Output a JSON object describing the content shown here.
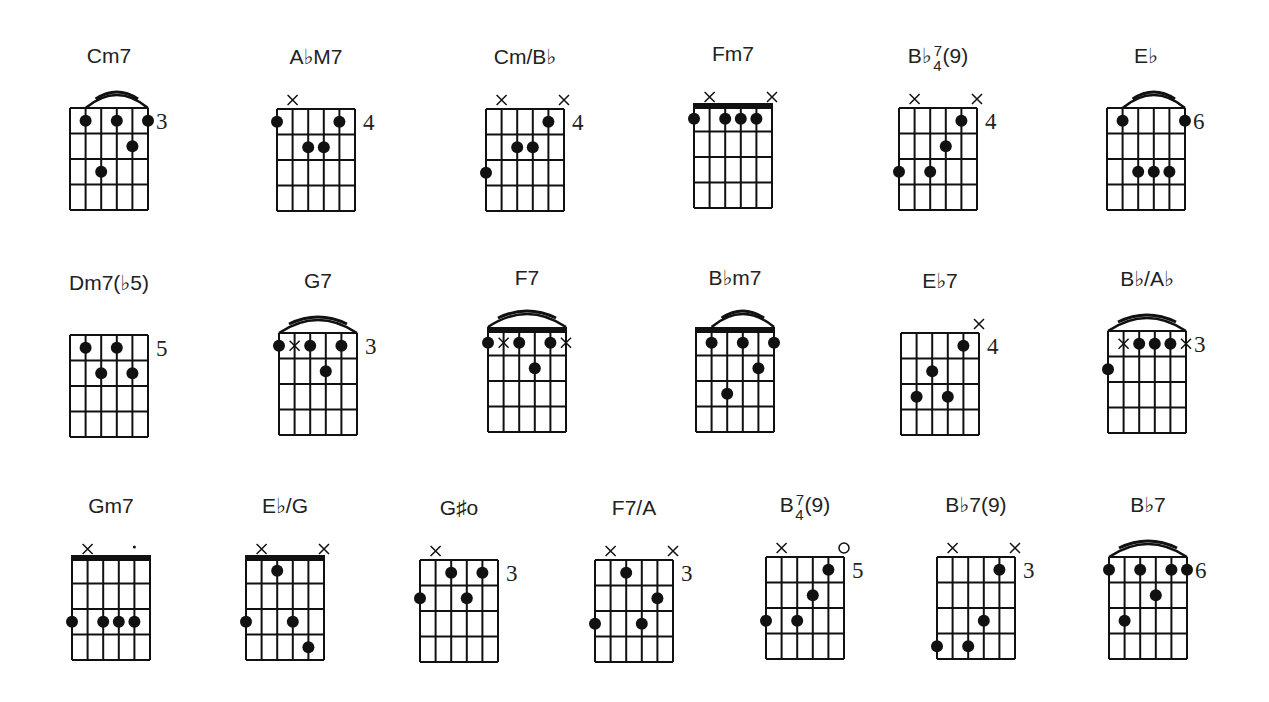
{
  "chords": [
    {
      "name": "Cm7",
      "root": "Cm7",
      "sup": "",
      "sub": "",
      "suffix": "",
      "fret": "3",
      "barre": "arc",
      "arc": [
        2,
        6
      ],
      "dots": [
        [
          2,
          1
        ],
        [
          4,
          1
        ],
        [
          6,
          1
        ],
        [
          5,
          2
        ],
        [
          3,
          3
        ]
      ],
      "mutes": [],
      "opens": []
    },
    {
      "name": "A♭M7",
      "root": "A♭M7",
      "sup": "",
      "sub": "",
      "suffix": "",
      "fret": "4",
      "barre": "none",
      "dots": [
        [
          1,
          1
        ],
        [
          5,
          1
        ],
        [
          3,
          2
        ],
        [
          4,
          2
        ]
      ],
      "mutes": [
        [
          2,
          0
        ]
      ],
      "opens": []
    },
    {
      "name": "Cm/B♭",
      "root": "Cm/B♭",
      "sup": "",
      "sub": "",
      "suffix": "",
      "fret": "4",
      "barre": "none",
      "dots": [
        [
          5,
          1
        ],
        [
          3,
          2
        ],
        [
          4,
          2
        ],
        [
          1,
          3
        ]
      ],
      "mutes": [
        [
          2,
          0
        ],
        [
          6,
          0
        ]
      ],
      "opens": []
    },
    {
      "name": "Fm7",
      "root": "Fm7",
      "sup": "",
      "sub": "",
      "suffix": "",
      "fret": "",
      "barre": "nut",
      "dots": [
        [
          1,
          1
        ],
        [
          3,
          1
        ],
        [
          4,
          1
        ],
        [
          5,
          1
        ]
      ],
      "mutes": [
        [
          2,
          0
        ],
        [
          6,
          0
        ]
      ],
      "opens": []
    },
    {
      "name": "B♭7/4(9)",
      "root": "B♭",
      "sup": "7",
      "sub": "4",
      "suffix": "(9)",
      "fret": "4",
      "barre": "none",
      "dots": [
        [
          5,
          1
        ],
        [
          4,
          2
        ],
        [
          1,
          3
        ],
        [
          3,
          3
        ]
      ],
      "mutes": [
        [
          2,
          0
        ],
        [
          6,
          0
        ]
      ],
      "opens": []
    },
    {
      "name": "E♭",
      "root": "E♭",
      "sup": "",
      "sub": "",
      "suffix": "",
      "fret": "6",
      "barre": "arc",
      "arc": [
        2,
        6
      ],
      "dots": [
        [
          2,
          1
        ],
        [
          6,
          1
        ],
        [
          3,
          3
        ],
        [
          4,
          3
        ],
        [
          5,
          3
        ]
      ],
      "mutes": [],
      "opens": []
    },
    {
      "name": "Dm7(♭5)",
      "root": "Dm7(♭5)",
      "sup": "",
      "sub": "",
      "suffix": "",
      "fret": "5",
      "barre": "none",
      "dots": [
        [
          2,
          1
        ],
        [
          4,
          1
        ],
        [
          3,
          2
        ],
        [
          5,
          2
        ]
      ],
      "mutes": [],
      "opens": []
    },
    {
      "name": "G7",
      "root": "G7",
      "sup": "",
      "sub": "",
      "suffix": "",
      "fret": "3",
      "barre": "arc",
      "arc": [
        1,
        6
      ],
      "dots": [
        [
          1,
          1
        ],
        [
          3,
          1
        ],
        [
          5,
          1
        ],
        [
          4,
          2
        ]
      ],
      "mutes": [
        [
          2,
          1
        ]
      ],
      "opens": []
    },
    {
      "name": "F7",
      "root": "F7",
      "sup": "",
      "sub": "",
      "suffix": "",
      "fret": "",
      "barre": "arc+nut",
      "arc": [
        1,
        6
      ],
      "dots": [
        [
          1,
          1
        ],
        [
          3,
          1
        ],
        [
          5,
          1
        ],
        [
          4,
          2
        ]
      ],
      "mutes": [
        [
          2,
          1
        ],
        [
          6,
          1
        ]
      ],
      "opens": []
    },
    {
      "name": "B♭m7",
      "root": "B♭m7",
      "sup": "",
      "sub": "",
      "suffix": "",
      "fret": "",
      "barre": "arc+nut",
      "arc": [
        2,
        6
      ],
      "dots": [
        [
          2,
          1
        ],
        [
          4,
          1
        ],
        [
          6,
          1
        ],
        [
          5,
          2
        ],
        [
          3,
          3
        ]
      ],
      "mutes": [],
      "opens": []
    },
    {
      "name": "E♭7",
      "root": "E♭7",
      "sup": "",
      "sub": "",
      "suffix": "",
      "fret": "4",
      "barre": "none",
      "dots": [
        [
          5,
          1
        ],
        [
          3,
          2
        ],
        [
          2,
          3
        ],
        [
          4,
          3
        ]
      ],
      "mutes": [
        [
          6,
          0
        ]
      ],
      "opens": []
    },
    {
      "name": "B♭/A♭",
      "root": "B♭/A♭",
      "sup": "",
      "sub": "",
      "suffix": "",
      "fret": "3",
      "barre": "arc",
      "arc": [
        1,
        6
      ],
      "dots": [
        [
          3,
          1
        ],
        [
          4,
          1
        ],
        [
          5,
          1
        ],
        [
          1,
          2
        ]
      ],
      "mutes": [
        [
          2,
          1
        ],
        [
          6,
          1
        ]
      ],
      "opens": []
    },
    {
      "name": "Gm7",
      "root": "Gm7",
      "sup": "",
      "sub": "",
      "suffix": "",
      "fret": "",
      "barre": "nut",
      "dots": [
        [
          1,
          3
        ],
        [
          3,
          3
        ],
        [
          4,
          3
        ],
        [
          5,
          3
        ]
      ],
      "mutes": [
        [
          2,
          0
        ]
      ],
      "opens": [],
      "marks": [
        [
          5,
          0
        ]
      ]
    },
    {
      "name": "E♭/G",
      "root": "E♭/G",
      "sup": "",
      "sub": "",
      "suffix": "",
      "fret": "",
      "barre": "nut",
      "dots": [
        [
          3,
          1
        ],
        [
          1,
          3
        ],
        [
          4,
          3
        ],
        [
          5,
          4
        ]
      ],
      "mutes": [
        [
          2,
          0
        ],
        [
          6,
          0
        ]
      ],
      "opens": []
    },
    {
      "name": "G♯o",
      "root": "G♯o",
      "sup": "",
      "sub": "",
      "suffix": "",
      "fret": "3",
      "barre": "none",
      "dots": [
        [
          3,
          1
        ],
        [
          5,
          1
        ],
        [
          1,
          2
        ],
        [
          4,
          2
        ]
      ],
      "mutes": [
        [
          2,
          0
        ]
      ],
      "opens": []
    },
    {
      "name": "F7/A",
      "root": "F7/A",
      "sup": "",
      "sub": "",
      "suffix": "",
      "fret": "3",
      "barre": "none",
      "dots": [
        [
          3,
          1
        ],
        [
          5,
          2
        ],
        [
          1,
          3
        ],
        [
          4,
          3
        ]
      ],
      "mutes": [
        [
          2,
          0
        ],
        [
          6,
          0
        ]
      ],
      "opens": []
    },
    {
      "name": "B 7/4(9)",
      "root": "B",
      "sup": "7",
      "sub": "4",
      "suffix": "(9)",
      "fret": "5",
      "barre": "none",
      "dots": [
        [
          5,
          1
        ],
        [
          4,
          2
        ],
        [
          1,
          3
        ],
        [
          3,
          3
        ]
      ],
      "mutes": [
        [
          2,
          0
        ]
      ],
      "opens": [
        [
          6,
          0
        ]
      ]
    },
    {
      "name": "B♭7(9)",
      "root": "B♭7(9)",
      "sup": "",
      "sub": "",
      "suffix": "",
      "fret": "3",
      "barre": "none",
      "dots": [
        [
          5,
          1
        ],
        [
          4,
          3
        ],
        [
          1,
          4
        ],
        [
          3,
          4
        ]
      ],
      "mutes": [
        [
          2,
          0
        ],
        [
          6,
          0
        ]
      ],
      "opens": []
    },
    {
      "name": "B♭7",
      "root": "B♭7",
      "sup": "",
      "sub": "",
      "suffix": "",
      "fret": "6",
      "barre": "arc",
      "arc": [
        1,
        6
      ],
      "dots": [
        [
          1,
          1
        ],
        [
          3,
          1
        ],
        [
          5,
          1
        ],
        [
          6,
          1
        ],
        [
          4,
          2
        ],
        [
          2,
          3
        ]
      ],
      "mutes": [],
      "opens": []
    }
  ]
}
